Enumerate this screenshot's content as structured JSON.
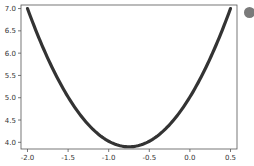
{
  "chart_data": {
    "type": "line",
    "title": "",
    "xlabel": "",
    "ylabel": "",
    "xlim": [
      -2.08,
      0.58
    ],
    "ylim": [
      3.85,
      7.08
    ],
    "x_ticks": [
      -2.0,
      -1.5,
      -1.0,
      -0.5,
      0.0,
      0.5
    ],
    "x_tick_labels": [
      "-2.0",
      "-1.5",
      "-1.0",
      "-0.5",
      "0.0",
      "0.5"
    ],
    "y_ticks": [
      4.0,
      4.5,
      5.0,
      5.5,
      6.0,
      6.5,
      7.0
    ],
    "y_tick_labels": [
      "4.0",
      "4.5",
      "5.0",
      "5.5",
      "6.0",
      "6.5",
      "7.0"
    ],
    "grid": false,
    "legend": null,
    "series": [
      {
        "name": "curve",
        "color": "#333333",
        "x": [
          -2.0,
          -1.75,
          -1.5,
          -1.25,
          -1.0,
          -0.75,
          -0.5,
          -0.25,
          0.0,
          0.25,
          0.5
        ],
        "y": [
          7.0,
          6.17,
          5.48,
          4.93,
          4.52,
          3.9,
          4.52,
          4.93,
          5.48,
          6.17,
          7.0
        ]
      }
    ]
  },
  "badge": {
    "icon": "circle-icon",
    "color": "#7a7a7a"
  }
}
